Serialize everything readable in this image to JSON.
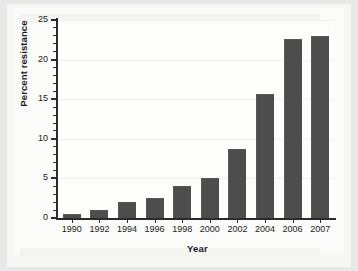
{
  "chart_data": {
    "type": "bar",
    "title": "",
    "xlabel": "Year",
    "ylabel": "Percent resistance",
    "categories": [
      "1990",
      "1992",
      "1994",
      "1996",
      "1998",
      "2000",
      "2002",
      "2004",
      "2006",
      "2007"
    ],
    "values": [
      0.5,
      1.0,
      2.0,
      2.5,
      4.0,
      5.0,
      8.7,
      15.7,
      22.6,
      23.0
    ],
    "series": [
      {
        "name": "Percent resistance",
        "values": [
          0.5,
          1.0,
          2.0,
          2.5,
          4.0,
          5.0,
          8.7,
          15.7,
          22.6,
          23.0
        ]
      }
    ],
    "ylim": [
      0,
      25
    ],
    "ytick_labels": [
      "0",
      "5",
      "10",
      "15",
      "20",
      "25"
    ],
    "ytick_values": [
      0,
      5,
      10,
      15,
      20,
      25
    ],
    "yminor_step": 1,
    "grid": "faint-horizontal",
    "legend": "none",
    "bar_color": "#4d4d4d",
    "axis_color": "#2b2b2b",
    "background_color": "#fbfbf9",
    "annotations": []
  }
}
